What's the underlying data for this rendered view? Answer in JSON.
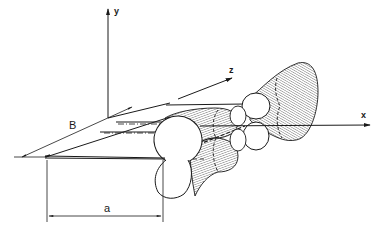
{
  "diagram": {
    "type": "3d-radiation-pattern-schematic",
    "axes": {
      "x": {
        "label": "x"
      },
      "y": {
        "label": "y"
      },
      "z": {
        "label": "z"
      }
    },
    "dimensions": {
      "a": {
        "label": "a"
      },
      "B": {
        "label": "B"
      }
    },
    "colors": {
      "ink": "#1a1a1a",
      "background": "#ffffff",
      "hatch": "#3a3a3a"
    }
  }
}
